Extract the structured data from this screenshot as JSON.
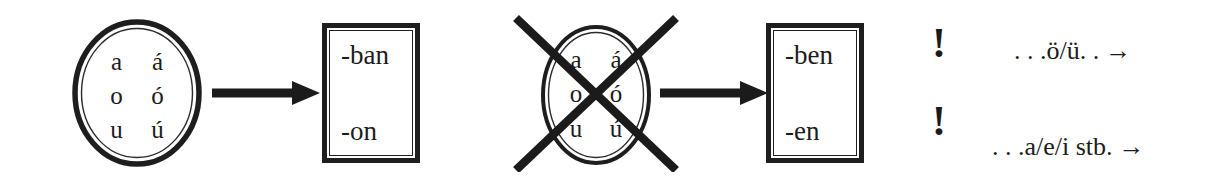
{
  "diagram": {
    "background_color": "#ffffff",
    "ink_color": "#1c1c1c"
  },
  "vowel_sets": [
    {
      "id": "back-vowels-valid",
      "state": "allowed",
      "crossed_out": false,
      "letters": [
        "a",
        "á",
        "o",
        "ó",
        "u",
        "ú"
      ],
      "rows": [
        [
          "a",
          "á"
        ],
        [
          "o",
          "ó"
        ],
        [
          "u",
          "ú"
        ]
      ]
    },
    {
      "id": "back-vowels-crossed",
      "state": "excluded",
      "crossed_out": true,
      "letters": [
        "a",
        "á",
        "o",
        "ó",
        "u",
        "ú"
      ],
      "rows": [
        [
          "a",
          "á"
        ],
        [
          "o",
          "ó"
        ],
        [
          "u",
          "ú"
        ]
      ]
    }
  ],
  "arrows": [
    {
      "id": "arrow-1",
      "direction": "right",
      "glyph": "→"
    },
    {
      "id": "arrow-2",
      "direction": "right",
      "glyph": "→"
    }
  ],
  "suffix_boxes": [
    {
      "id": "suffix-box-ban-on",
      "lines": [
        "-ban",
        "-on"
      ],
      "top": "-ban",
      "bottom": "-on"
    },
    {
      "id": "suffix-box-ben-en",
      "lines": [
        "-ben",
        "-en"
      ],
      "top": "-ben",
      "bottom": "-en"
    }
  ],
  "notes": [
    {
      "id": "note-front-rounded",
      "marker": "!",
      "text": ". . .ö/ü. .",
      "arrow": "→"
    },
    {
      "id": "note-front-unrounded",
      "marker": "!",
      "text": ". . .a/e/i stb.",
      "arrow": "→"
    }
  ]
}
